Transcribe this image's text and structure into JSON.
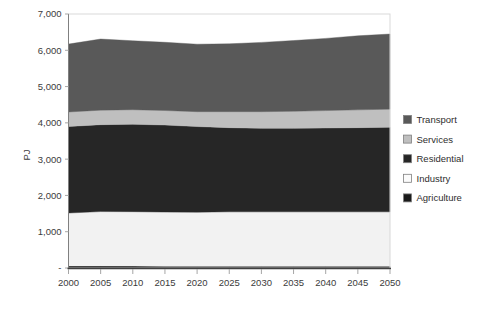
{
  "chart_data": {
    "type": "area",
    "title": "",
    "subtitle": "",
    "xlabel": "",
    "ylabel": "PJ",
    "stacked": true,
    "grid": false,
    "legend_position": "right",
    "x": [
      2000,
      2005,
      2010,
      2015,
      2020,
      2025,
      2030,
      2035,
      2040,
      2045,
      2050
    ],
    "categories": [
      "2000",
      "2005",
      "2010",
      "2015",
      "2020",
      "2025",
      "2030",
      "2035",
      "2040",
      "2045",
      "2050"
    ],
    "xlim": [
      2000,
      2050
    ],
    "ylim": [
      0,
      7000
    ],
    "ytick_values": [
      0,
      1000,
      2000,
      3000,
      4000,
      5000,
      6000,
      7000
    ],
    "ytick_labels": [
      "-",
      "1,000",
      "2,000",
      "3,000",
      "4,000",
      "5,000",
      "6,000",
      "7,000"
    ],
    "series": [
      {
        "name": "Agriculture",
        "color": "#1a1a1a",
        "values": [
          55,
          55,
          52,
          50,
          48,
          48,
          48,
          48,
          48,
          48,
          48
        ]
      },
      {
        "name": "Industry",
        "color": "#f2f2f2",
        "values": [
          1460,
          1500,
          1500,
          1490,
          1490,
          1500,
          1500,
          1500,
          1500,
          1500,
          1500
        ]
      },
      {
        "name": "Residential",
        "color": "#262626",
        "values": [
          2385,
          2395,
          2410,
          2400,
          2360,
          2320,
          2300,
          2300,
          2310,
          2320,
          2330
        ]
      },
      {
        "name": "Services",
        "color": "#bfbfbf",
        "values": [
          400,
          400,
          400,
          400,
          410,
          440,
          460,
          470,
          480,
          490,
          500
        ]
      },
      {
        "name": "Transport",
        "color": "#595959",
        "values": [
          1870,
          1960,
          1900,
          1880,
          1860,
          1870,
          1910,
          1950,
          1990,
          2040,
          2070
        ]
      }
    ],
    "stack_order_bottom_to_top": [
      "Agriculture",
      "Industry",
      "Residential",
      "Services",
      "Transport"
    ],
    "totals": [
      6170,
      6310,
      6262,
      6220,
      6168,
      6178,
      6218,
      6268,
      6328,
      6398,
      6448
    ]
  },
  "legend": {
    "items": [
      {
        "label": "Transport",
        "color": "#595959"
      },
      {
        "label": "Services",
        "color": "#bfbfbf"
      },
      {
        "label": "Residential",
        "color": "#262626"
      },
      {
        "label": "Industry",
        "color": "#fbfbfb"
      },
      {
        "label": "Agriculture",
        "color": "#1a1a1a"
      }
    ]
  },
  "axes": {
    "y_title": "PJ"
  }
}
